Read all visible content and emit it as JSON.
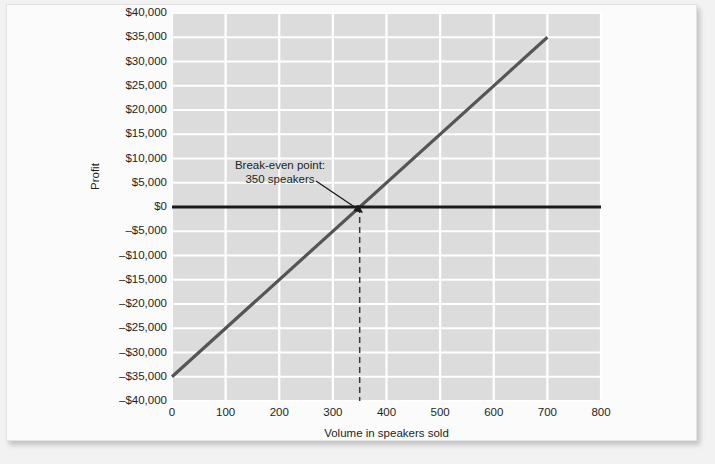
{
  "chart_data": {
    "type": "line",
    "title": "",
    "xlabel": "Volume in speakers sold",
    "ylabel": "Profit",
    "xlim": [
      0,
      800
    ],
    "ylim": [
      -40000,
      40000
    ],
    "grid": true,
    "legend_position": "none",
    "x_ticks": [
      "0",
      "100",
      "200",
      "300",
      "400",
      "500",
      "600",
      "700",
      "800"
    ],
    "x_tick_values": [
      0,
      100,
      200,
      300,
      400,
      500,
      600,
      700,
      800
    ],
    "y_ticks": [
      "$40,000",
      "$35,000",
      "$30,000",
      "$25,000",
      "$20,000",
      "$15,000",
      "$10,000",
      "$5,000",
      "$0",
      "–$5,000",
      "–$10,000",
      "–$15,000",
      "–$20,000",
      "–$25,000",
      "–$30,000",
      "–$35,000",
      "–$40,000"
    ],
    "y_tick_values": [
      40000,
      35000,
      30000,
      25000,
      20000,
      15000,
      10000,
      5000,
      0,
      -5000,
      -10000,
      -15000,
      -20000,
      -25000,
      -30000,
      -35000,
      -40000
    ],
    "series": [
      {
        "name": "Profit",
        "style": "solid",
        "color": "#555555",
        "x": [
          0,
          700
        ],
        "values": [
          -35000,
          35000
        ]
      },
      {
        "name": "Zero profit line",
        "style": "solid",
        "color": "#1a1a1a",
        "x": [
          0,
          800
        ],
        "values": [
          0,
          0
        ]
      },
      {
        "name": "Break-even volume marker",
        "style": "dashed",
        "color": "#3a3a3a",
        "x": [
          350,
          350
        ],
        "values": [
          0,
          -40000
        ]
      }
    ],
    "annotations": [
      {
        "name": "break-even-callout",
        "line1": "Break-even point:",
        "line2": "350 speakers",
        "points_to_x": 350,
        "points_to_y": 0
      }
    ],
    "colors": {
      "plot_background": "#dcdcdc",
      "gridline": "#ffffff",
      "profit_line": "#555555",
      "zero_line": "#1a1a1a",
      "dashed_marker": "#3a3a3a",
      "text": "#231f20",
      "page_background": "#fbfbfb"
    }
  }
}
